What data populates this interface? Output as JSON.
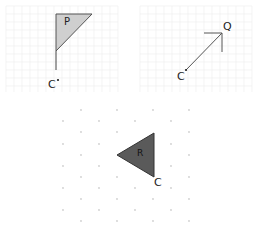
{
  "figures": {
    "panel_p": {
      "shape_label": "P",
      "center_label": "C",
      "fill": "#cfcfcf",
      "stroke": "#555555"
    },
    "panel_q": {
      "point_label": "Q",
      "center_label": "C",
      "stroke": "#555555"
    },
    "panel_r": {
      "shape_label": "R",
      "center_label": "C",
      "fill": "#5a5a5a",
      "stroke": "#333333"
    }
  },
  "grid": {
    "line_color": "#ececec",
    "dot_color": "#cfcfcf"
  }
}
